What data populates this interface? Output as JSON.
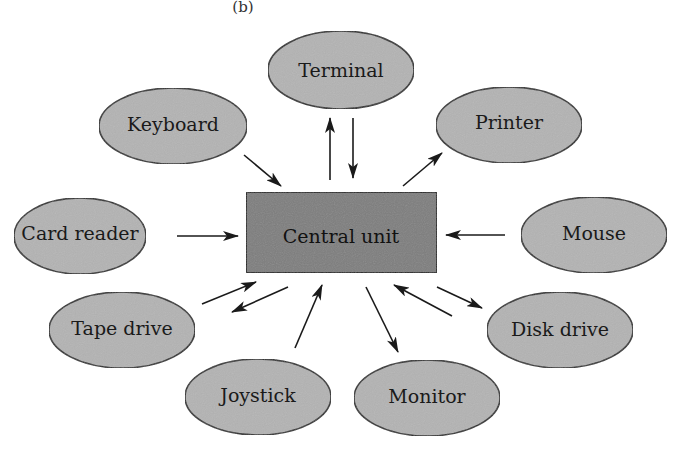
{
  "figure_label": "(b)",
  "colors": {
    "ellipse_fill": "#b3b3b3",
    "ellipse_stroke": "#2a2a2a",
    "central_fill": "#7d7d7d",
    "central_stroke": "#1e1e1e",
    "arrow": "#1a1a1a",
    "background": "#ffffff"
  },
  "central": {
    "label": "Central unit"
  },
  "nodes": [
    {
      "id": "terminal",
      "label": "Terminal"
    },
    {
      "id": "keyboard",
      "label": "Keyboard"
    },
    {
      "id": "printer",
      "label": "Printer"
    },
    {
      "id": "card-reader",
      "label": "Card reader"
    },
    {
      "id": "mouse",
      "label": "Mouse"
    },
    {
      "id": "tape-drive",
      "label": "Tape drive"
    },
    {
      "id": "disk-drive",
      "label": "Disk drive"
    },
    {
      "id": "joystick",
      "label": "Joystick"
    },
    {
      "id": "monitor",
      "label": "Monitor"
    }
  ],
  "connections": [
    {
      "from": "Terminal",
      "to": "Central unit"
    },
    {
      "from": "Central unit",
      "to": "Terminal"
    },
    {
      "from": "Keyboard",
      "to": "Central unit"
    },
    {
      "from": "Central unit",
      "to": "Printer"
    },
    {
      "from": "Card reader",
      "to": "Central unit"
    },
    {
      "from": "Mouse",
      "to": "Central unit"
    },
    {
      "from": "Tape drive",
      "to": "Central unit"
    },
    {
      "from": "Central unit",
      "to": "Tape drive"
    },
    {
      "from": "Joystick",
      "to": "Central unit"
    },
    {
      "from": "Central unit",
      "to": "Monitor"
    },
    {
      "from": "Disk drive",
      "to": "Central unit"
    },
    {
      "from": "Central unit",
      "to": "Disk drive"
    }
  ]
}
